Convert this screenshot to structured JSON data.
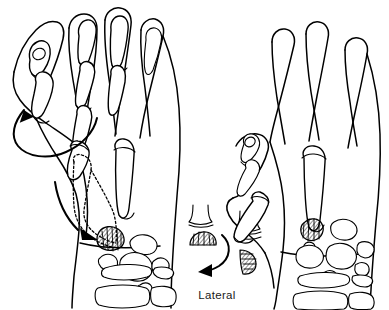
{
  "figure": {
    "background_color": "#ffffff",
    "ink_color": "#000000",
    "width": 389,
    "height": 310
  },
  "captions": {
    "lateral_label": "Lateral"
  },
  "panels": [
    {
      "id": "left-hand",
      "name": "preoperative-hand-view",
      "description": "Left hand dorsal view with skeletal outline, thumb shown in original position with dotted transposition outline"
    },
    {
      "id": "right-hand",
      "name": "postoperative-hand-view",
      "description": "Right hand dorsal view with thumb metacarpal rotated into opposition"
    },
    {
      "id": "inset-lateral",
      "name": "lateral-cross-section-inset",
      "description": "Lateral cross-section pair showing the hatched osteotomy fragment before and after 90 degree rotation"
    }
  ],
  "annotations": {
    "rotation_arrow_left": "counter-clockwise rotation arrow indicating thumb pronation",
    "transposition_arrow": "arrow from dotted metacarpal outline to trapezium base",
    "inset_rotation_arrow": "clockwise arrow showing 90 degree rotation of graft fragment"
  },
  "bone_groups": {
    "left_phalanges": "thumb and finger phalanges",
    "left_metacarpals": "metacarpal shafts",
    "left_carpals": "carpal bone cluster",
    "left_trapezium": "hatched trapezium at thumb base",
    "forearm_bones": "radius and ulna ends",
    "right_phalanges": "thumb and finger phalanges",
    "right_metacarpals": "metacarpal shafts",
    "right_carpals": "carpal bone cluster",
    "right_trapezium": "hatched trapezium rotated"
  }
}
